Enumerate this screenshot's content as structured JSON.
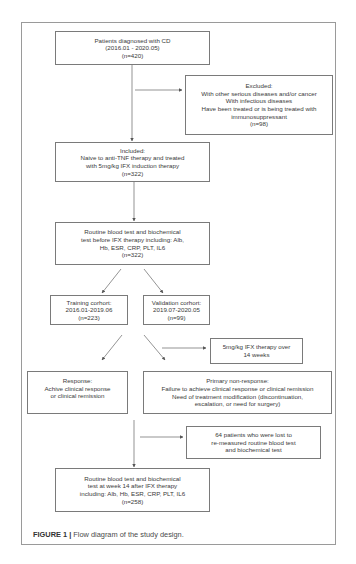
{
  "figure": {
    "caption_label": "FIGURE 1 |",
    "caption_text": " Flow diagram of the study design."
  },
  "boxes": {
    "diagnosed": {
      "lines": [
        "Patients diagnosed with CD",
        "(2016.01 - 2020.05)",
        "(n=420)"
      ]
    },
    "excluded": {
      "lines": [
        "Excluded:",
        "With other serious diseases and/or cancer",
        "With infectious diseases",
        "Have been treated or  is being treated with",
        "immunosuppressant",
        "(n=98)"
      ]
    },
    "included": {
      "lines": [
        "Included:",
        "Naive to anti-TNF therapy and treated",
        "with 5mg/kg IFX induction therapy",
        "(n=322)"
      ]
    },
    "baseline_tests": {
      "lines": [
        "Routine blood test and biochemical",
        "test before IFX therapy including: Alb,",
        "Hb, ESR, CRP, PLT, IL6",
        "(n=322)"
      ]
    },
    "training": {
      "lines": [
        "Training corhort:",
        "2016.01-2019.06",
        "(n=223)"
      ]
    },
    "validation": {
      "lines": [
        "Validation corhort:",
        "2019.07-2020.05",
        "(n=99)"
      ]
    },
    "therapy": {
      "lines": [
        "5mg/kg IFX therapy over",
        "14 weeks"
      ]
    },
    "response": {
      "lines": [
        "Response:",
        "Achive  clinical response",
        "or clinical remission"
      ]
    },
    "non_response": {
      "lines": [
        "Primary non-response:",
        "Failure to achieve clinical response or clinical remission",
        "Need of treatment modification (discontinuation,",
        "escalation, or need for surgery)"
      ]
    },
    "lost": {
      "lines": [
        "64 patients who were lost to",
        "re-measured  routine blood test",
        "and biochemical test"
      ]
    },
    "week14_tests": {
      "lines": [
        "Routine blood test and biochemical",
        "test at week 14 after IFX therapy",
        "including: Alb, Hb, ESR, CRP, PLT, IL6",
        "(n=258)"
      ]
    }
  },
  "colors": {
    "box_border": "#7a7a7a",
    "frame_border": "#9a9a9a",
    "arrow": "#555555",
    "text": "#3a3a3a"
  }
}
